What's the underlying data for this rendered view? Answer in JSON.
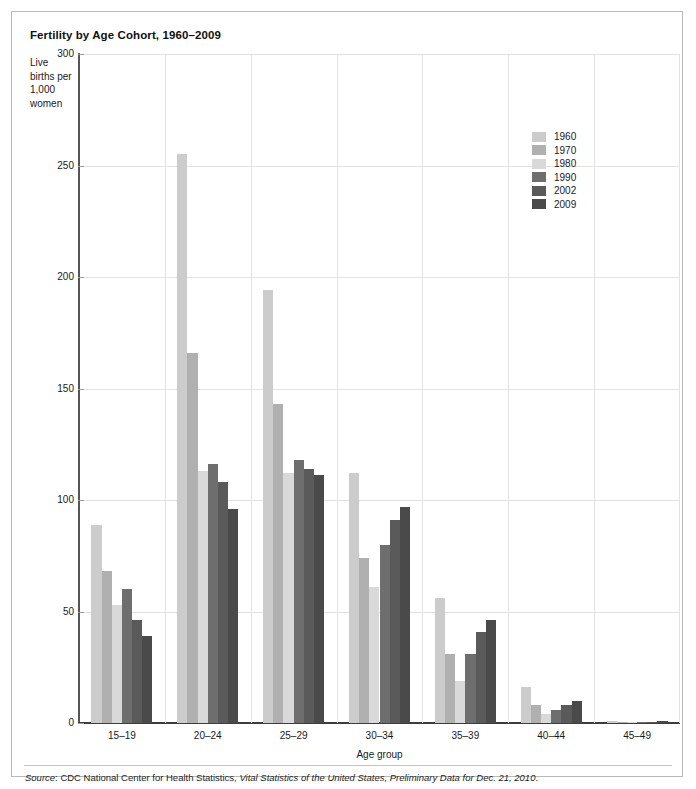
{
  "figure": {
    "title": "Fertility by Age Cohort, 1960–2009",
    "source_prefix": "Source",
    "source_sep": ": CDC National Center for Health Statistics, ",
    "source_italic": "Vital Statistics of the United States, Preliminary Data for Dec. 21, 2010",
    "source_end": "."
  },
  "chart_data": {
    "type": "bar",
    "title": "Fertility by Age Cohort, 1960–2009",
    "xlabel": "Age group",
    "ylabel": "Live births per 1,000 women",
    "ylim": [
      0,
      300
    ],
    "yticks": [
      0,
      50,
      100,
      150,
      200,
      250,
      300
    ],
    "grid": "horizontal-and-vertical",
    "legend_position": "upper-right-inside",
    "categories": [
      "15–19",
      "20–24",
      "25–29",
      "30–34",
      "35–39",
      "40–44",
      "45–49"
    ],
    "series": [
      {
        "name": "1960",
        "color": "#cccccc",
        "values": [
          89,
          255,
          194,
          112,
          56,
          16,
          0.9
        ]
      },
      {
        "name": "1970",
        "color": "#b0b0b0",
        "values": [
          68,
          166,
          143,
          74,
          31,
          8,
          0.5
        ]
      },
      {
        "name": "1980",
        "color": "#d9d9d9",
        "values": [
          53,
          113,
          112,
          61,
          19,
          4,
          0.2
        ]
      },
      {
        "name": "1990",
        "color": "#6e6e6e",
        "values": [
          60,
          116,
          118,
          80,
          31,
          6,
          0.3
        ]
      },
      {
        "name": "2002",
        "color": "#5a5a5a",
        "values": [
          46,
          108,
          114,
          91,
          41,
          8,
          0.5
        ]
      },
      {
        "name": "2009",
        "color": "#4a4a4a",
        "values": [
          39,
          96,
          111,
          97,
          46,
          10,
          0.7
        ]
      }
    ]
  }
}
